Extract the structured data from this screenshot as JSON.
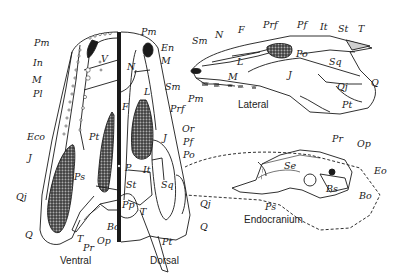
{
  "figure": {
    "ink": "#1a1a1a",
    "stipple": "#3a3a3a",
    "captions": {
      "ventral": "Ventral",
      "dorsal": "Dorsal",
      "lateral": "Lateral",
      "endocranium": "Endocranium"
    },
    "ventral_labels": [
      "Pm",
      "In",
      "M",
      "Pl",
      "Eco",
      "Pt",
      "V",
      "J",
      "Qj",
      "Q",
      "Ps",
      "T",
      "Pr",
      "Op",
      "Bo"
    ],
    "dorsal_labels": [
      "Pm",
      "En",
      "M",
      "N",
      "Sm",
      "L",
      "F",
      "Prf",
      "Or",
      "J",
      "Pf",
      "Po",
      "P",
      "It",
      "St",
      "Sq",
      "Pp",
      "T",
      "Qj",
      "Q",
      "Pt"
    ],
    "lateral_labels": [
      "Sm",
      "N",
      "F",
      "Prf",
      "Pf",
      "It",
      "St",
      "T",
      "L",
      "Po",
      "Sq",
      "M",
      "J",
      "Qj",
      "Q",
      "Pm",
      "Pt"
    ],
    "endocranium_labels": [
      "Pr",
      "Op",
      "Se",
      "Eo",
      "Bs",
      "Bo",
      "Ps"
    ]
  }
}
